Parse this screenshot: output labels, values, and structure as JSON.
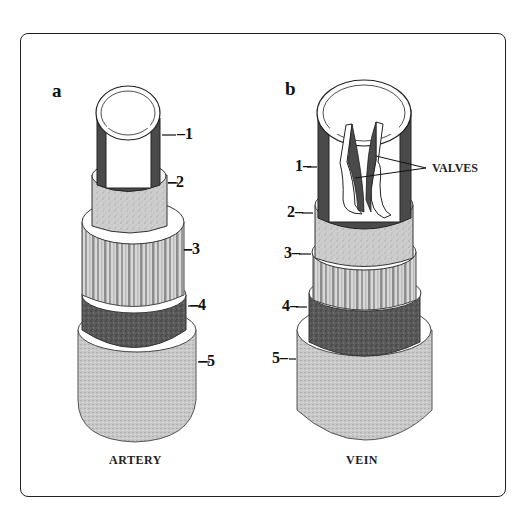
{
  "figure": {
    "panels": [
      {
        "id": "a",
        "label": "a",
        "caption": "ARTERY",
        "layer_labels": [
          "–1",
          "–2",
          "–3",
          "–4",
          "–5"
        ]
      },
      {
        "id": "b",
        "label": "b",
        "caption": "VEIN",
        "layer_labels": [
          "1–",
          "2–",
          "3–",
          "4–",
          "5–"
        ],
        "annotation": "VALVES"
      }
    ],
    "layers": [
      {
        "number": "1",
        "description": "inner lining (endothelium)",
        "shade": "#4a4a4a"
      },
      {
        "number": "2",
        "description": "connective layer",
        "shade": "#cfcfcf"
      },
      {
        "number": "3",
        "description": "muscular layer",
        "shade": "#bdbdbd"
      },
      {
        "number": "4",
        "description": "elastic layer",
        "shade": "#5c5c5c"
      },
      {
        "number": "5",
        "description": "outer coat",
        "shade": "#c4c4c4"
      }
    ]
  }
}
